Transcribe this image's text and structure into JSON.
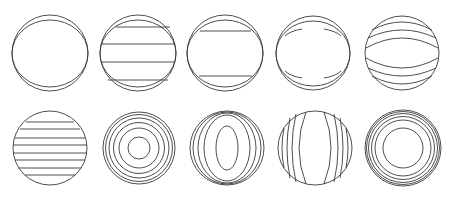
{
  "figure": {
    "width": 452,
    "height": 198,
    "stroke_color": "#3a3a3a",
    "background": "#ffffff",
    "rows": [
      {
        "name": "top-row",
        "panels": [
          {
            "id": "t1",
            "cx": 50,
            "cy": 53,
            "r": 38,
            "pattern": "two-offset-circles"
          },
          {
            "id": "t2",
            "cx": 138,
            "cy": 53,
            "r": 38,
            "pattern": "offset-circles-with-four-horizontal-lines"
          },
          {
            "id": "t3",
            "cx": 225,
            "cy": 53,
            "r": 38,
            "pattern": "offset-circles-with-two-horizontal-lines"
          },
          {
            "id": "t4",
            "cx": 313,
            "cy": 53,
            "r": 37,
            "pattern": "offset-circles-with-four-corner-lenses"
          },
          {
            "id": "t5",
            "cx": 402,
            "cy": 53,
            "r": 37,
            "pattern": "circle-with-wavy-horizontal-bands"
          }
        ]
      },
      {
        "name": "bottom-row",
        "panels": [
          {
            "id": "b1",
            "cx": 50,
            "cy": 148,
            "r": 37,
            "pattern": "straight-parallel-fringes"
          },
          {
            "id": "b2",
            "cx": 139,
            "cy": 148,
            "r": 36,
            "pattern": "concentric-ring-fringes"
          },
          {
            "id": "b3",
            "cx": 227,
            "cy": 148,
            "r": 37,
            "pattern": "elliptical-ring-fringes"
          },
          {
            "id": "b4",
            "cx": 315,
            "cy": 148,
            "r": 37,
            "pattern": "curved-vertical-fringes"
          },
          {
            "id": "b5",
            "cx": 403,
            "cy": 148,
            "r": 38,
            "pattern": "concentric-ring-fringes-dense-edge"
          }
        ]
      }
    ]
  }
}
